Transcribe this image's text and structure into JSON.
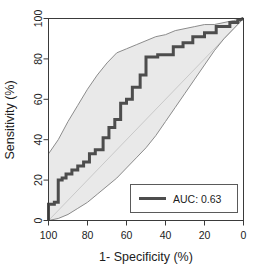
{
  "chart_data": {
    "type": "line",
    "title": "",
    "subtitle": "",
    "xlabel": "1- Specificity (%)",
    "ylabel": "Sensitivity (%)",
    "xlim": [
      100,
      0
    ],
    "ylim": [
      0,
      100
    ],
    "x_reversed": true,
    "grid": false,
    "legend_position": "bottom-right",
    "xticks": [
      100,
      80,
      60,
      40,
      20,
      0
    ],
    "xtick_labels": [
      "100",
      "80",
      "60",
      "40",
      "20",
      "0"
    ],
    "yticks": [
      0,
      20,
      40,
      60,
      80,
      100
    ],
    "ytick_labels": [
      "0",
      "20",
      "40",
      "60",
      "80",
      "100"
    ],
    "annotations": [
      {
        "text": "AUC: 0.63",
        "kind": "legend-entry"
      }
    ],
    "legend": [
      {
        "label": "AUC: 0.63",
        "color": "#4d4d4d",
        "style": "thick-line"
      }
    ],
    "series": [
      {
        "name": "ROC curve",
        "label": "AUC: 0.63",
        "type": "step",
        "color": "#4d4d4d",
        "linewidth": 3,
        "x": [
          100,
          100,
          97,
          97,
          95,
          95,
          93,
          93,
          91,
          91,
          88,
          88,
          85,
          85,
          82,
          82,
          79,
          79,
          76,
          76,
          72,
          72,
          69,
          69,
          66,
          66,
          63,
          63,
          60,
          60,
          57,
          57,
          53,
          53,
          50,
          50,
          44,
          44,
          36,
          36,
          31,
          31,
          26,
          26,
          20,
          20,
          14,
          14,
          7,
          7,
          3,
          3,
          0
        ],
        "y": [
          0,
          8,
          8,
          9,
          9,
          20,
          20,
          21,
          21,
          23,
          23,
          25,
          25,
          27,
          27,
          29,
          29,
          33,
          33,
          35,
          35,
          41,
          41,
          46,
          46,
          50,
          50,
          58,
          58,
          60,
          60,
          66,
          66,
          72,
          72,
          81,
          81,
          82,
          82,
          86,
          86,
          88,
          88,
          91,
          91,
          93,
          93,
          96,
          96,
          98,
          98,
          99,
          100
        ]
      },
      {
        "name": "Upper 95% CI",
        "type": "line",
        "color": "#8c8c8c",
        "linewidth": 1,
        "x": [
          100,
          95,
          90,
          85,
          80,
          75,
          70,
          65,
          60,
          55,
          50,
          45,
          40,
          35,
          30,
          25,
          20,
          15,
          10,
          5,
          0
        ],
        "y": [
          33,
          40,
          49,
          57,
          65,
          72,
          78,
          83,
          85,
          87,
          89,
          91,
          92,
          94,
          95,
          96,
          97,
          97,
          98,
          99,
          100
        ]
      },
      {
        "name": "Lower 95% CI",
        "type": "line",
        "color": "#8c8c8c",
        "linewidth": 1,
        "x": [
          100,
          95,
          90,
          85,
          80,
          75,
          70,
          65,
          60,
          55,
          50,
          45,
          40,
          35,
          30,
          25,
          20,
          15,
          10,
          5,
          0
        ],
        "y": [
          0,
          1,
          3,
          6,
          9,
          13,
          17,
          21,
          26,
          31,
          36,
          42,
          49,
          56,
          63,
          70,
          77,
          84,
          90,
          95,
          100
        ]
      },
      {
        "name": "Reference diagonal",
        "type": "line",
        "color": "#c9c9c9",
        "linewidth": 1,
        "x": [
          100,
          0
        ],
        "y": [
          0,
          100
        ]
      }
    ],
    "band": {
      "name": "95% confidence band",
      "fill": "#e9e9e9",
      "edge": "#8c8c8c"
    },
    "colors": {
      "curve": "#4d4d4d",
      "band_fill": "#e9e9e9",
      "band_edge": "#8c8c8c",
      "diagonal": "#c9c9c9",
      "axis": "#3a3a3a",
      "text": "#1c1c1c",
      "background": "#ffffff"
    }
  },
  "legend_box": {
    "entry_label": "AUC: 0.63"
  },
  "axes": {
    "x_title": "1- Specificity (%)",
    "y_title": "Sensitivity (%)"
  }
}
